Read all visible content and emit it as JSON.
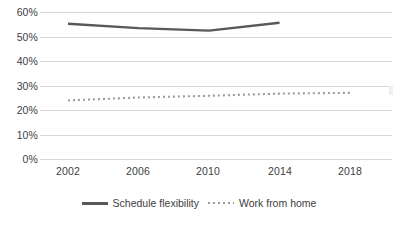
{
  "chart_data": {
    "type": "line",
    "title": "",
    "xlabel": "",
    "ylabel": "",
    "x": [
      2002,
      2004,
      2006,
      2008,
      2010,
      2012,
      2014,
      2016,
      2018
    ],
    "xlim": [
      2001,
      2019
    ],
    "ylim": [
      0,
      60
    ],
    "xticks": [
      "2002",
      "2006",
      "2010",
      "2014",
      "2018"
    ],
    "yticks": [
      "0%",
      "10%",
      "20%",
      "30%",
      "40%",
      "50%",
      "60%"
    ],
    "ytick_values": [
      0,
      10,
      20,
      30,
      40,
      50,
      60
    ],
    "grid": "horizontal",
    "legend_position": "bottom",
    "series": [
      {
        "name": "Schedule flexibility",
        "style": "solid",
        "color": "#595959",
        "x": [
          2002,
          2006,
          2010,
          2014
        ],
        "values": [
          55.2,
          53.4,
          52.4,
          55.6
        ]
      },
      {
        "name": "Work from home",
        "style": "dotted",
        "color": "#9c9c9c",
        "x": [
          2002,
          2006,
          2010,
          2014,
          2018
        ],
        "values": [
          23.9,
          25.1,
          25.8,
          26.7,
          27.0
        ]
      }
    ]
  },
  "axes": {
    "y_labels": [
      "60%",
      "50%",
      "40%",
      "30%",
      "20%",
      "10%",
      "0%"
    ],
    "x_labels": [
      "2002",
      "2006",
      "2010",
      "2014",
      "2018"
    ]
  },
  "legend": {
    "items": [
      {
        "label": "Schedule flexibility",
        "swatch": "solid-line-swatch"
      },
      {
        "label": "Work from home",
        "swatch": "dotted-line-swatch"
      }
    ]
  },
  "caption": {
    "sliver_text": ""
  },
  "colors": {
    "series_solid": "#595959",
    "series_dotted": "#9c9c9c",
    "gridline": "#d9d9d9",
    "text": "#404040",
    "background": "#ffffff"
  }
}
